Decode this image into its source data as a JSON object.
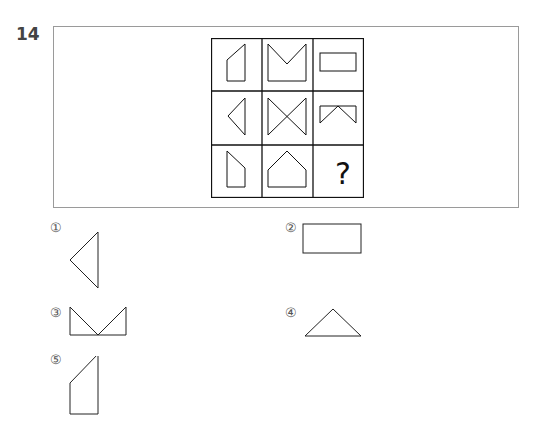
{
  "question": {
    "number": "14",
    "grid": {
      "rows": 3,
      "cols": 3,
      "cells": [
        {
          "row": 1,
          "col": 1,
          "shape": "pentagon-cut-top-left"
        },
        {
          "row": 1,
          "col": 2,
          "shape": "m-shape-notched-square"
        },
        {
          "row": 1,
          "col": 3,
          "shape": "horizontal-rectangle"
        },
        {
          "row": 2,
          "col": 1,
          "shape": "left-pointing-triangle"
        },
        {
          "row": 2,
          "col": 2,
          "shape": "bowtie-hourglass"
        },
        {
          "row": 2,
          "col": 3,
          "shape": "rectangle-top-notched-v"
        },
        {
          "row": 3,
          "col": 1,
          "shape": "pentagon-cut-bottom-right"
        },
        {
          "row": 3,
          "col": 2,
          "shape": "house-pentagon"
        },
        {
          "row": 3,
          "col": 3,
          "shape": "question-mark",
          "text": "?"
        }
      ]
    },
    "options": [
      {
        "label": "①",
        "shape": "left-pointing-triangle"
      },
      {
        "label": "②",
        "shape": "horizontal-rectangle"
      },
      {
        "label": "③",
        "shape": "double-triangle-w"
      },
      {
        "label": "④",
        "shape": "upward-triangle"
      },
      {
        "label": "⑤",
        "shape": "pentagon-cut-top-left"
      }
    ]
  }
}
